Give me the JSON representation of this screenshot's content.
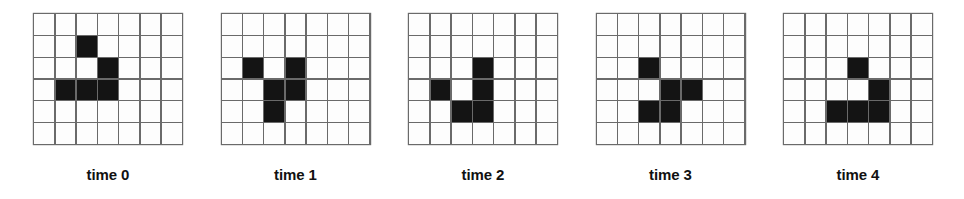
{
  "figure": {
    "grid_columns": 7,
    "grid_rows": 6,
    "colors": {
      "cell_on": "#141414",
      "cell_off": "#fdfdfd",
      "gridline": "#6a6a6a",
      "label_text": "#111111",
      "background": "#ffffff"
    }
  },
  "panels": [
    {
      "label": "time 0",
      "name": "grid-time-0",
      "filled_cells": [
        [
          2,
          1
        ],
        [
          3,
          2
        ],
        [
          1,
          3
        ],
        [
          2,
          3
        ],
        [
          3,
          3
        ]
      ],
      "cells": [
        [
          0,
          0,
          0,
          0,
          0,
          0,
          0
        ],
        [
          0,
          0,
          1,
          0,
          0,
          0,
          0
        ],
        [
          0,
          0,
          0,
          1,
          0,
          0,
          0
        ],
        [
          0,
          1,
          1,
          1,
          0,
          0,
          0
        ],
        [
          0,
          0,
          0,
          0,
          0,
          0,
          0
        ],
        [
          0,
          0,
          0,
          0,
          0,
          0,
          0
        ]
      ]
    },
    {
      "label": "time 1",
      "name": "grid-time-1",
      "filled_cells": [
        [
          1,
          2
        ],
        [
          3,
          2
        ],
        [
          2,
          3
        ],
        [
          3,
          3
        ],
        [
          2,
          4
        ]
      ],
      "cells": [
        [
          0,
          0,
          0,
          0,
          0,
          0,
          0
        ],
        [
          0,
          0,
          0,
          0,
          0,
          0,
          0
        ],
        [
          0,
          1,
          0,
          1,
          0,
          0,
          0
        ],
        [
          0,
          0,
          1,
          1,
          0,
          0,
          0
        ],
        [
          0,
          0,
          1,
          0,
          0,
          0,
          0
        ],
        [
          0,
          0,
          0,
          0,
          0,
          0,
          0
        ]
      ]
    },
    {
      "label": "time 2",
      "name": "grid-time-2",
      "filled_cells": [
        [
          3,
          2
        ],
        [
          1,
          3
        ],
        [
          3,
          3
        ],
        [
          2,
          4
        ],
        [
          3,
          4
        ]
      ],
      "cells": [
        [
          0,
          0,
          0,
          0,
          0,
          0,
          0
        ],
        [
          0,
          0,
          0,
          0,
          0,
          0,
          0
        ],
        [
          0,
          0,
          0,
          1,
          0,
          0,
          0
        ],
        [
          0,
          1,
          0,
          1,
          0,
          0,
          0
        ],
        [
          0,
          0,
          1,
          1,
          0,
          0,
          0
        ],
        [
          0,
          0,
          0,
          0,
          0,
          0,
          0
        ]
      ]
    },
    {
      "label": "time 3",
      "name": "grid-time-3",
      "filled_cells": [
        [
          2,
          2
        ],
        [
          3,
          3
        ],
        [
          4,
          3
        ],
        [
          2,
          4
        ],
        [
          3,
          4
        ]
      ],
      "cells": [
        [
          0,
          0,
          0,
          0,
          0,
          0,
          0
        ],
        [
          0,
          0,
          0,
          0,
          0,
          0,
          0
        ],
        [
          0,
          0,
          1,
          0,
          0,
          0,
          0
        ],
        [
          0,
          0,
          0,
          1,
          1,
          0,
          0
        ],
        [
          0,
          0,
          1,
          1,
          0,
          0,
          0
        ],
        [
          0,
          0,
          0,
          0,
          0,
          0,
          0
        ]
      ]
    },
    {
      "label": "time 4",
      "name": "grid-time-4",
      "filled_cells": [
        [
          3,
          2
        ],
        [
          4,
          3
        ],
        [
          2,
          4
        ],
        [
          3,
          4
        ],
        [
          4,
          4
        ]
      ],
      "cells": [
        [
          0,
          0,
          0,
          0,
          0,
          0,
          0
        ],
        [
          0,
          0,
          0,
          0,
          0,
          0,
          0
        ],
        [
          0,
          0,
          0,
          1,
          0,
          0,
          0
        ],
        [
          0,
          0,
          0,
          0,
          1,
          0,
          0
        ],
        [
          0,
          0,
          1,
          1,
          1,
          0,
          0
        ],
        [
          0,
          0,
          0,
          0,
          0,
          0,
          0
        ]
      ]
    }
  ]
}
